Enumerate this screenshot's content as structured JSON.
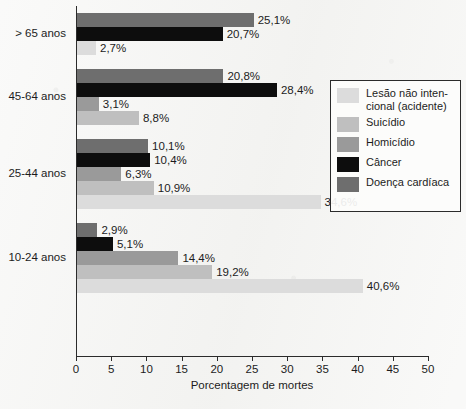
{
  "chart_data": {
    "type": "bar",
    "orientation": "horizontal",
    "title": "",
    "xlabel": "Porcentagem de mortes",
    "ylabel": "",
    "xlim": [
      0,
      50
    ],
    "xticks": [
      0,
      5,
      10,
      15,
      20,
      25,
      30,
      35,
      40,
      45,
      50
    ],
    "xtick_labels": [
      "0",
      "5",
      "10",
      "15",
      "20",
      "25",
      "30",
      "35",
      "40",
      "45",
      "50"
    ],
    "grid": false,
    "value_suffix": "%",
    "decimal_separator": ",",
    "legend_position": "right",
    "categories": [
      "> 65 anos",
      "45-64 anos",
      "25-44 anos",
      "10-24 anos"
    ],
    "series": [
      {
        "name": "Lesão não intencional (acidente)",
        "label_line1": "Lesão não inten-",
        "label_line2": "cional (acidente)",
        "color": "#dcdcdc",
        "values": [
          2.7,
          3.1,
          34.6,
          40.6
        ],
        "value_labels": [
          "2,7%",
          "3,1%",
          "34,6%",
          "40,6%"
        ]
      },
      {
        "name": "Suicídio",
        "color": "#bfbfbf",
        "values": [
          null,
          8.8,
          10.9,
          19.2
        ],
        "value_labels": [
          null,
          "8,8%",
          "10,9%",
          "19,2%"
        ]
      },
      {
        "name": "Homicídio",
        "color": "#9a9a9a",
        "values": [
          null,
          3.1,
          6.3,
          14.4
        ],
        "value_labels": [
          null,
          "3,1%",
          "6,3%",
          "14,4%"
        ]
      },
      {
        "name": "Câncer",
        "color": "#0d0d0d",
        "values": [
          20.7,
          28.4,
          10.4,
          5.1
        ],
        "value_labels": [
          "20,7%",
          "28,4%",
          "10,4%",
          "5,1%"
        ]
      },
      {
        "name": "Doença cardíaca",
        "color": "#6e6e6e",
        "values": [
          25.1,
          20.8,
          10.1,
          2.9
        ],
        "value_labels": [
          "25,1%",
          "20,8%",
          "10,1%",
          "2,9%"
        ]
      }
    ],
    "groups": [
      {
        "category": "> 65 anos",
        "bars": [
          {
            "series": "Doença cardíaca",
            "value": 25.1,
            "label": "25,1%",
            "color": "#6e6e6e"
          },
          {
            "series": "Câncer",
            "value": 20.7,
            "label": "20,7%",
            "color": "#0d0d0d"
          },
          {
            "series": "Lesão não intencional (acidente)",
            "value": 2.7,
            "label": "2,7%",
            "color": "#dcdcdc"
          }
        ]
      },
      {
        "category": "45-64 anos",
        "bars": [
          {
            "series": "Doença cardíaca",
            "value": 20.8,
            "label": "20,8%",
            "color": "#6e6e6e"
          },
          {
            "series": "Câncer",
            "value": 28.4,
            "label": "28,4%",
            "color": "#0d0d0d"
          },
          {
            "series": "Homicídio",
            "value": 3.1,
            "label": "3,1%",
            "color": "#9a9a9a"
          },
          {
            "series": "Suicídio",
            "value": 8.8,
            "label": "8,8%",
            "color": "#bfbfbf"
          }
        ]
      },
      {
        "category": "25-44 anos",
        "bars": [
          {
            "series": "Doença cardíaca",
            "value": 10.1,
            "label": "10,1%",
            "color": "#6e6e6e"
          },
          {
            "series": "Câncer",
            "value": 10.4,
            "label": "10,4%",
            "color": "#0d0d0d"
          },
          {
            "series": "Homicídio",
            "value": 6.3,
            "label": "6,3%",
            "color": "#9a9a9a"
          },
          {
            "series": "Suicídio",
            "value": 10.9,
            "label": "10,9%",
            "color": "#bfbfbf"
          },
          {
            "series": "Lesão não intencional (acidente)",
            "value": 34.6,
            "label": "34,6%",
            "color": "#dcdcdc"
          }
        ]
      },
      {
        "category": "10-24 anos",
        "bars": [
          {
            "series": "Doença cardíaca",
            "value": 2.9,
            "label": "2,9%",
            "color": "#6e6e6e"
          },
          {
            "series": "Câncer",
            "value": 5.1,
            "label": "5,1%",
            "color": "#0d0d0d"
          },
          {
            "series": "Homicídio",
            "value": 14.4,
            "label": "14,4%",
            "color": "#9a9a9a"
          },
          {
            "series": "Suicídio",
            "value": 19.2,
            "label": "19,2%",
            "color": "#bfbfbf"
          },
          {
            "series": "Lesão não intencional (acidente)",
            "value": 40.6,
            "label": "40,6%",
            "color": "#dcdcdc"
          }
        ]
      }
    ],
    "legend_entries": [
      {
        "label": "Lesão não intencional (acidente)",
        "line1": "Lesão não inten-",
        "line2": "cional (acidente)",
        "color": "#dcdcdc"
      },
      {
        "label": "Suicídio",
        "line1": "Suicídio",
        "line2": "",
        "color": "#bfbfbf"
      },
      {
        "label": "Homicídio",
        "line1": "Homicídio",
        "line2": "",
        "color": "#9a9a9a"
      },
      {
        "label": "Câncer",
        "line1": "Câncer",
        "line2": "",
        "color": "#0d0d0d"
      },
      {
        "label": "Doença cardíaca",
        "line1": "Doença cardíaca",
        "line2": "",
        "color": "#6e6e6e"
      }
    ]
  }
}
